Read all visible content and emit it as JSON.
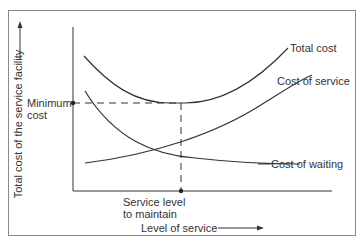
{
  "diagram": {
    "y_axis_label": "Total cost of the service facility",
    "x_axis_label": "Level of service",
    "curves": [
      {
        "name": "total",
        "label": "Total cost"
      },
      {
        "name": "service",
        "label": "Cost of service"
      },
      {
        "name": "waiting",
        "label": "Cost of waiting"
      }
    ],
    "markers": {
      "min_cost_line1": "Minimum",
      "min_cost_line2": "cost",
      "service_level_line1": "Service level",
      "service_level_line2": "to maintain"
    },
    "colors": {
      "line": "#333333",
      "frame": "#8a8a8a"
    }
  }
}
